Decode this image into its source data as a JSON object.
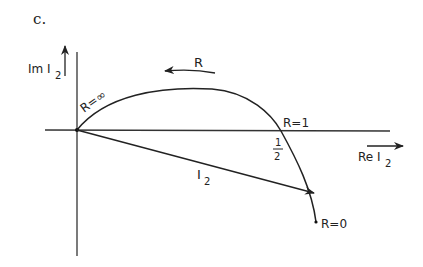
{
  "figure": {
    "panel_label": "c.",
    "axis_y_label": "Im I",
    "axis_y_sub": "2",
    "axis_x_label": "Re I",
    "axis_x_sub": "2",
    "direction_label": "R",
    "label_r_inf": "R=∞",
    "label_r_one": "R=1",
    "label_r_zero": "R=0",
    "half_num": "1",
    "half_den": "2",
    "phasor_label": "I",
    "phasor_sub": "2"
  },
  "colors": {
    "ink": "#222222",
    "background": "#ffffff"
  }
}
